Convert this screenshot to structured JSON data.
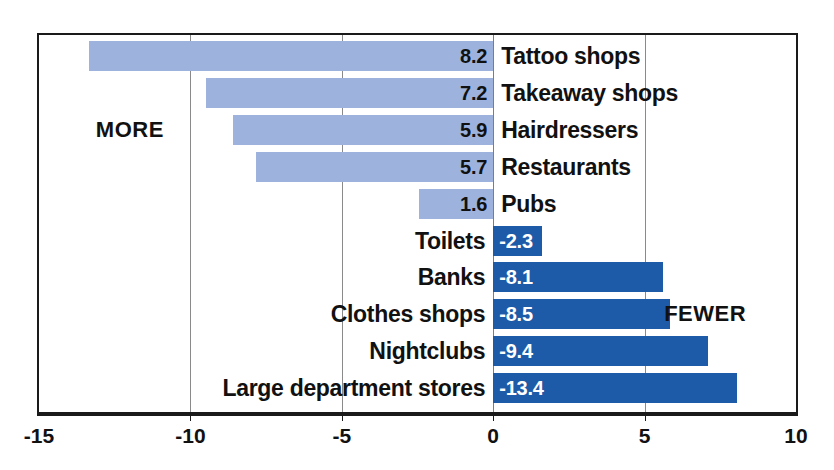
{
  "chart_data": {
    "type": "bar",
    "title": "",
    "subtitle": "",
    "xlabel": "",
    "ylabel": "",
    "orientation": "horizontal",
    "xlim": [
      -15,
      10
    ],
    "xticks": [
      -15,
      -10,
      -5,
      0,
      5,
      10
    ],
    "xtick_labels": [
      "-15",
      "-10",
      "-5",
      "0",
      "5",
      "10"
    ],
    "grid": true,
    "grid_axis": "x",
    "legend": "none",
    "annotations": [
      {
        "text": "MORE",
        "x": -12.0,
        "y_row": 2
      },
      {
        "text": "FEWER",
        "x": 7.0,
        "y_row": 7
      }
    ],
    "colors": {
      "more": "#9db3de",
      "fewer": "#1d5ba8",
      "frame": "#1a1a1a",
      "gridline": "#8a8a8a",
      "text": "#111111",
      "value_label_fewer": "#ffffff",
      "background": "#ffffff"
    },
    "categories": [
      "Tattoo shops",
      "Takeaway shops",
      "Hairdressers",
      "Restaurants",
      "Pubs",
      "Toilets",
      "Banks",
      "Clothes shops",
      "Nightclubs",
      "Large department stores"
    ],
    "values": [
      8.2,
      7.2,
      5.9,
      5.7,
      1.6,
      -2.3,
      -8.1,
      -8.5,
      -9.4,
      -13.4
    ],
    "bars": [
      {
        "category": "Tattoo shops",
        "value": 8.2,
        "value_label": "8.2",
        "group": "more",
        "bar_start": -13.35,
        "bar_end": 0,
        "label_side": "right"
      },
      {
        "category": "Takeaway shops",
        "value": 7.2,
        "value_label": "7.2",
        "group": "more",
        "bar_start": -9.5,
        "bar_end": 0,
        "label_side": "right"
      },
      {
        "category": "Hairdressers",
        "value": 5.9,
        "value_label": "5.9",
        "group": "more",
        "bar_start": -8.6,
        "bar_end": 0,
        "label_side": "right"
      },
      {
        "category": "Restaurants",
        "value": 5.7,
        "value_label": "5.7",
        "group": "more",
        "bar_start": -7.85,
        "bar_end": 0,
        "label_side": "right"
      },
      {
        "category": "Pubs",
        "value": 1.6,
        "value_label": "1.6",
        "group": "more",
        "bar_start": -2.45,
        "bar_end": 0,
        "label_side": "right"
      },
      {
        "category": "Toilets",
        "value": -2.3,
        "value_label": "-2.3",
        "group": "fewer",
        "bar_start": 0,
        "bar_end": 1.6,
        "label_side": "left"
      },
      {
        "category": "Banks",
        "value": -8.1,
        "value_label": "-8.1",
        "group": "fewer",
        "bar_start": 0,
        "bar_end": 5.6,
        "label_side": "left"
      },
      {
        "category": "Clothes shops",
        "value": -8.5,
        "value_label": "-8.5",
        "group": "fewer",
        "bar_start": 0,
        "bar_end": 5.85,
        "label_side": "left"
      },
      {
        "category": "Nightclubs",
        "value": -9.4,
        "value_label": "-9.4",
        "group": "fewer",
        "bar_start": 0,
        "bar_end": 7.1,
        "label_side": "left"
      },
      {
        "category": "Large department stores",
        "value": -13.4,
        "value_label": "-13.4",
        "group": "fewer",
        "bar_start": 0,
        "bar_end": 8.05,
        "label_side": "left"
      }
    ]
  }
}
